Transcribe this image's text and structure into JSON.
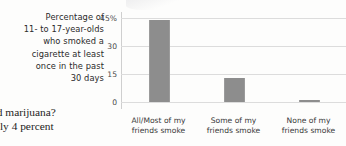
{
  "caption": {
    "lines": [
      "Percentage of",
      "11- to 17-year-olds",
      "who smoked a",
      "cigarette at least",
      "once in the past",
      "30 days"
    ]
  },
  "body_text": {
    "lines": [
      "ked marijuana?",
      "Only 4 percent"
    ]
  },
  "chart_data": {
    "type": "bar",
    "title": "Percentage of 11- to 17-year-olds who smoked a cigarette at least once in the past 30 days",
    "xlabel": "",
    "ylabel": "",
    "categories": [
      "All/Most of my friends smoke",
      "Some of my friends smoke",
      "None of my friends smoke"
    ],
    "category_lines": [
      [
        "All/Most of my",
        "friends smoke"
      ],
      [
        "Some of my",
        "friends smoke"
      ],
      [
        "None of my",
        "friends smoke"
      ]
    ],
    "values": [
      44,
      13,
      1
    ],
    "ylim": [
      0,
      45
    ],
    "yticks": [
      0,
      15,
      30,
      45
    ],
    "ytick_labels": [
      "0",
      "15",
      "30",
      "45%"
    ],
    "grid": true,
    "legend": "none",
    "bar_color": "#8d8d8d",
    "grid_color": "#dcdcdc",
    "axis_color": "#cfcfcf"
  }
}
